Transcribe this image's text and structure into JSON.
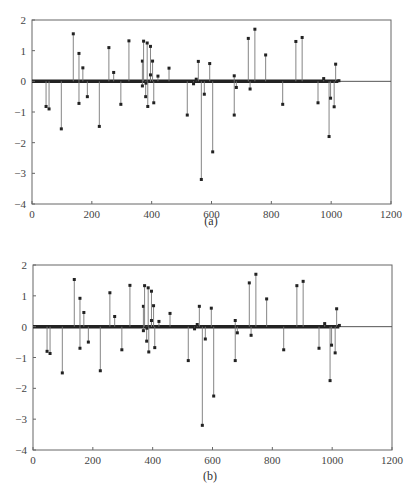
{
  "chart_data": [
    {
      "type": "stem",
      "panel_label": "(a)",
      "title": "",
      "xlabel": "",
      "ylabel": "",
      "xlim": [
        0,
        1200
      ],
      "ylim": [
        -4,
        2
      ],
      "xticks": [
        0,
        200,
        400,
        600,
        800,
        1000,
        1200
      ],
      "yticks": [
        2,
        1,
        0,
        -1,
        -2,
        -3,
        -4
      ],
      "grid": false,
      "baseline": {
        "y": 0,
        "dense_region": [
          0,
          1024
        ]
      },
      "points": [
        [
          47,
          -0.82
        ],
        [
          57,
          -0.9
        ],
        [
          98,
          -1.55
        ],
        [
          138,
          1.55
        ],
        [
          157,
          0.91
        ],
        [
          157,
          -0.72
        ],
        [
          170,
          0.44
        ],
        [
          185,
          -0.5
        ],
        [
          225,
          -1.47
        ],
        [
          257,
          1.1
        ],
        [
          273,
          0.29
        ],
        [
          297,
          -0.75
        ],
        [
          324,
          1.32
        ],
        [
          369,
          0.66
        ],
        [
          369,
          -0.15
        ],
        [
          373,
          1.31
        ],
        [
          380,
          -0.5
        ],
        [
          381,
          -0.06
        ],
        [
          385,
          1.25
        ],
        [
          387,
          -0.82
        ],
        [
          396,
          1.14
        ],
        [
          396,
          0.21
        ],
        [
          403,
          0.66
        ],
        [
          407,
          -0.7
        ],
        [
          421,
          0.17
        ],
        [
          458,
          0.43
        ],
        [
          519,
          -1.1
        ],
        [
          540,
          -0.08
        ],
        [
          549,
          0.07
        ],
        [
          556,
          0.65
        ],
        [
          566,
          -3.2
        ],
        [
          576,
          -0.42
        ],
        [
          594,
          0.58
        ],
        [
          604,
          -2.3
        ],
        [
          676,
          0.18
        ],
        [
          676,
          -1.1
        ],
        [
          683,
          -0.2
        ],
        [
          723,
          1.4
        ],
        [
          729,
          -0.25
        ],
        [
          745,
          1.7
        ],
        [
          781,
          0.86
        ],
        [
          838,
          -0.75
        ],
        [
          882,
          1.3
        ],
        [
          903,
          1.43
        ],
        [
          956,
          -0.7
        ],
        [
          975,
          0.09
        ],
        [
          993,
          -1.8
        ],
        [
          998,
          -0.55
        ],
        [
          1010,
          -0.83
        ],
        [
          1015,
          0.56
        ],
        [
          1026,
          0.02
        ]
      ]
    },
    {
      "type": "stem",
      "panel_label": "(b)",
      "title": "",
      "xlabel": "",
      "ylabel": "",
      "xlim": [
        0,
        1200
      ],
      "ylim": [
        -4,
        2
      ],
      "xticks": [
        0,
        200,
        400,
        600,
        800,
        1000,
        1200
      ],
      "yticks": [
        2,
        1,
        0,
        -1,
        -2,
        -3,
        -4
      ],
      "grid": false,
      "baseline": {
        "y": 0,
        "dense_region": [
          0,
          1024
        ]
      },
      "points": [
        [
          47,
          -0.8
        ],
        [
          57,
          -0.87
        ],
        [
          98,
          -1.5
        ],
        [
          138,
          1.53
        ],
        [
          157,
          0.92
        ],
        [
          157,
          -0.7
        ],
        [
          170,
          0.46
        ],
        [
          185,
          -0.5
        ],
        [
          225,
          -1.43
        ],
        [
          257,
          1.1
        ],
        [
          273,
          0.33
        ],
        [
          297,
          -0.75
        ],
        [
          324,
          1.34
        ],
        [
          369,
          0.66
        ],
        [
          369,
          -0.13
        ],
        [
          373,
          1.33
        ],
        [
          380,
          -0.47
        ],
        [
          381,
          -0.05
        ],
        [
          385,
          1.26
        ],
        [
          387,
          -0.82
        ],
        [
          396,
          1.15
        ],
        [
          396,
          0.2
        ],
        [
          403,
          0.68
        ],
        [
          407,
          -0.68
        ],
        [
          421,
          0.17
        ],
        [
          458,
          0.43
        ],
        [
          519,
          -1.1
        ],
        [
          540,
          -0.07
        ],
        [
          549,
          0.07
        ],
        [
          556,
          0.66
        ],
        [
          566,
          -3.2
        ],
        [
          576,
          -0.4
        ],
        [
          596,
          0.6
        ],
        [
          604,
          -2.25
        ],
        [
          676,
          0.2
        ],
        [
          676,
          -1.1
        ],
        [
          683,
          -0.2
        ],
        [
          723,
          1.42
        ],
        [
          729,
          -0.28
        ],
        [
          745,
          1.7
        ],
        [
          781,
          0.9
        ],
        [
          838,
          -0.75
        ],
        [
          882,
          1.33
        ],
        [
          903,
          1.47
        ],
        [
          956,
          -0.7
        ],
        [
          975,
          0.1
        ],
        [
          993,
          -1.75
        ],
        [
          998,
          -0.6
        ],
        [
          1010,
          -0.85
        ],
        [
          1015,
          0.58
        ],
        [
          1024,
          0.04
        ]
      ]
    }
  ],
  "panels": {
    "a": {
      "caption": "(a)"
    },
    "b": {
      "caption": "(b)"
    }
  }
}
